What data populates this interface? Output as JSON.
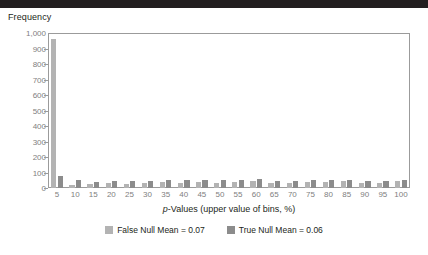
{
  "top_rule_color": "#231f20",
  "chart_data": {
    "type": "bar",
    "title": "",
    "ylabel": "Frequency",
    "xlabel": "p-Values (upper value of bins, %)",
    "grid": false,
    "legend_position": "bottom",
    "ylim": [
      0,
      1000
    ],
    "ytick_labels": [
      "1,000",
      "900",
      "800",
      "700",
      "600",
      "500",
      "400",
      "300",
      "200",
      "100",
      "0"
    ],
    "ytick_values": [
      1000,
      900,
      800,
      700,
      600,
      500,
      400,
      300,
      200,
      100,
      0
    ],
    "categories": [
      "5",
      "10",
      "15",
      "20",
      "25",
      "30",
      "35",
      "40",
      "45",
      "50",
      "55",
      "60",
      "65",
      "70",
      "75",
      "80",
      "85",
      "90",
      "95",
      "100"
    ],
    "series": [
      {
        "name": "False Null Mean = 0.07",
        "color": "#b3b3b3",
        "values": [
          960,
          20,
          25,
          30,
          25,
          32,
          38,
          30,
          42,
          30,
          40,
          48,
          35,
          30,
          42,
          38,
          45,
          35,
          30,
          48
        ]
      },
      {
        "name": "True Null Mean = 0.06",
        "color": "#8c8c8c",
        "values": [
          80,
          52,
          38,
          45,
          45,
          48,
          50,
          50,
          52,
          50,
          52,
          55,
          48,
          45,
          50,
          52,
          50,
          45,
          45,
          50
        ]
      }
    ]
  },
  "legend": {
    "items": [
      {
        "label": "False Null Mean = 0.07",
        "swatch_class": "false-null"
      },
      {
        "label": "True Null Mean = 0.06",
        "swatch_class": "true-null"
      }
    ]
  }
}
